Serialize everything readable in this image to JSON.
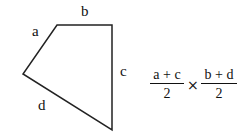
{
  "diagram": {
    "shape": "quadrilateral",
    "vertices": [
      [
        57,
        25
      ],
      [
        112,
        25
      ],
      [
        112,
        130
      ],
      [
        23,
        74
      ]
    ],
    "stroke_color": "#222222",
    "side_labels": {
      "a": "a",
      "b": "b",
      "c": "c",
      "d": "d"
    }
  },
  "formula": {
    "left": {
      "numerator": "a + c",
      "denominator": "2"
    },
    "operator": "×",
    "right": {
      "numerator": "b + d",
      "denominator": "2"
    }
  }
}
